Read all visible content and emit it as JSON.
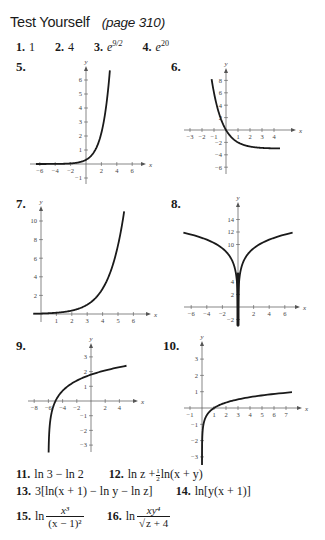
{
  "header": {
    "title": "Test Yourself",
    "page_ref": "(page 310)"
  },
  "answers_row1": [
    {
      "num": "1.",
      "text": "1"
    },
    {
      "num": "2.",
      "text": "4"
    },
    {
      "num": "3.",
      "base": "e",
      "exp": "9/2"
    },
    {
      "num": "4.",
      "base": "e",
      "exp": "20"
    }
  ],
  "answers_text": {
    "a11": {
      "num": "11.",
      "text": "ln 3 − ln 2"
    },
    "a12": {
      "num": "12.",
      "pre": "ln z +",
      "frac_n": "1",
      "frac_d": "2",
      "post": "ln(x + y)"
    },
    "a13": {
      "num": "13.",
      "text": "3[ln(x + 1) − ln y − ln z]"
    },
    "a14": {
      "num": "14.",
      "text": "ln[y(x + 1)]"
    },
    "a15": {
      "num": "15.",
      "pre": "ln",
      "numerator": "x³",
      "denominator": "(x − 1)²"
    },
    "a16": {
      "num": "16.",
      "pre": "ln",
      "numerator": "xy⁴",
      "denominator": "z + 4"
    }
  },
  "chart_data": [
    {
      "id": "5",
      "type": "line",
      "label": "5.",
      "xlabel": "x",
      "ylabel": "y",
      "xticks": [
        -6,
        -4,
        -2,
        2,
        4,
        6
      ],
      "yticks": [
        -1,
        1,
        2,
        3,
        4,
        5,
        6
      ],
      "xlim": [
        -7,
        7.5
      ],
      "ylim": [
        -1.5,
        7
      ],
      "origin_px": [
        86,
        164
      ],
      "scale_px": [
        7.7,
        14
      ],
      "x_axis_px": [
        30,
        142
      ],
      "y_axis_px": [
        184,
        70
      ],
      "function": "e^(x-1.2)",
      "x_range": [
        -6.5,
        3.1
      ],
      "points": [
        [
          -6.5,
          0.0
        ],
        [
          -2,
          0.04
        ],
        [
          0,
          0.3
        ],
        [
          1,
          0.82
        ],
        [
          2,
          2.23
        ],
        [
          2.5,
          3.67
        ],
        [
          3.1,
          6.7
        ]
      ]
    },
    {
      "id": "6",
      "type": "line",
      "label": "6.",
      "xlabel": "x",
      "ylabel": "y",
      "xticks": [
        -3,
        -2,
        -1,
        1,
        2,
        3,
        4
      ],
      "yticks": [
        -6,
        -4,
        -2,
        2,
        4,
        6,
        8
      ],
      "xlim": [
        -3.5,
        5
      ],
      "ylim": [
        -7,
        9.5
      ],
      "origin_px": [
        226,
        130
      ],
      "scale_px": [
        12,
        6.2
      ],
      "x_axis_px": [
        184,
        292
      ],
      "y_axis_px": [
        174,
        72
      ],
      "function": "3^(-x+1) - 3",
      "x_range": [
        -1.2,
        4.5
      ],
      "points": [
        [
          -1.2,
          8.2
        ],
        [
          -1,
          6
        ],
        [
          0,
          0
        ],
        [
          1,
          -2
        ],
        [
          2,
          -2.67
        ],
        [
          4.5,
          -2.98
        ]
      ]
    },
    {
      "id": "7",
      "type": "line",
      "label": "7.",
      "xlabel": "x",
      "ylabel": "y",
      "xticks": [
        1,
        2,
        3,
        4,
        5,
        6
      ],
      "yticks": [
        2,
        4,
        6,
        8,
        10
      ],
      "xlim": [
        -0.5,
        6.8
      ],
      "ylim": [
        -1,
        11.5
      ],
      "origin_px": [
        41,
        314
      ],
      "scale_px": [
        15.4,
        9.3
      ],
      "x_axis_px": [
        33,
        147
      ],
      "y_axis_px": [
        322,
        210
      ],
      "function": "e^(x-3)",
      "x_range": [
        -0.5,
        5.4
      ],
      "points": [
        [
          0,
          0.05
        ],
        [
          2,
          0.37
        ],
        [
          3,
          1
        ],
        [
          4,
          2.72
        ],
        [
          5,
          7.39
        ],
        [
          5.4,
          11.0
        ]
      ]
    },
    {
      "id": "8",
      "type": "line",
      "label": "8.",
      "xlabel": "x",
      "ylabel": "y",
      "xticks": [
        -6,
        -4,
        -2,
        2,
        4,
        6
      ],
      "yticks": [
        -2,
        2,
        4,
        10,
        12,
        14
      ],
      "xlim": [
        -7,
        7.5
      ],
      "ylim": [
        -3,
        16
      ],
      "origin_px": [
        238,
        307
      ],
      "scale_px": [
        7.8,
        6.25
      ],
      "x_axis_px": [
        184,
        296
      ],
      "y_axis_px": [
        325,
        206
      ],
      "function": "8 + ln(x²)",
      "x_range": [
        -7,
        7
      ],
      "points": [
        [
          -7,
          11.9
        ],
        [
          -4,
          10.8
        ],
        [
          -1,
          8
        ],
        [
          -0.1,
          3.4
        ],
        [
          0.1,
          3.4
        ],
        [
          1,
          8
        ],
        [
          4,
          10.8
        ],
        [
          7,
          11.9
        ]
      ]
    },
    {
      "id": "9",
      "type": "line",
      "label": "9.",
      "xlabel": "x",
      "ylabel": "y",
      "xticks": [
        -8,
        -6,
        -4,
        -2,
        2,
        4
      ],
      "yticks": [
        -3,
        -2,
        -1,
        1,
        2,
        3
      ],
      "xlim": [
        -9,
        5.5
      ],
      "ylim": [
        -3.5,
        4
      ],
      "origin_px": [
        91,
        401
      ],
      "scale_px": [
        7.1,
        14.7
      ],
      "x_axis_px": [
        28,
        134
      ],
      "y_axis_px": [
        452,
        347
      ],
      "function": "ln(x + 6)",
      "x_range": [
        -5.97,
        5
      ],
      "points": [
        [
          -5.97,
          -3.5
        ],
        [
          -5,
          0
        ],
        [
          -4,
          0.69
        ],
        [
          0,
          1.79
        ],
        [
          5,
          2.4
        ]
      ]
    },
    {
      "id": "10",
      "type": "line",
      "label": "10.",
      "xlabel": "x",
      "ylabel": "y",
      "xticks": [
        -1,
        1,
        2,
        3,
        4,
        5,
        6,
        7
      ],
      "yticks": [
        -3,
        -2,
        -1,
        1,
        2,
        3
      ],
      "xlim": [
        -1.5,
        8
      ],
      "ylim": [
        -3.5,
        4
      ],
      "origin_px": [
        202,
        408
      ],
      "scale_px": [
        12,
        16.3
      ],
      "x_axis_px": [
        184,
        298
      ],
      "y_axis_px": [
        464,
        345
      ],
      "function": "log base 8 of x",
      "x_range": [
        0.0005,
        7.5
      ],
      "points": [
        [
          0.0006,
          -3.5
        ],
        [
          0.5,
          -0.33
        ],
        [
          1,
          0
        ],
        [
          2,
          0.33
        ],
        [
          4,
          0.67
        ],
        [
          7.5,
          0.97
        ]
      ]
    }
  ]
}
